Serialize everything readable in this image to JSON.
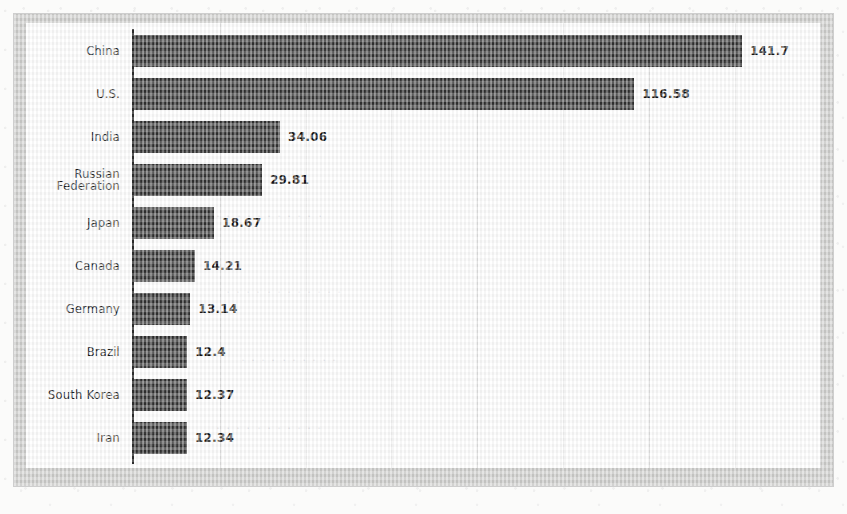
{
  "chart_data": {
    "type": "bar",
    "orientation": "horizontal",
    "title": "",
    "subtitle": "",
    "xlabel": "",
    "ylabel": "",
    "categories": [
      "China",
      "U.S.",
      "India",
      "Russian\nFederation",
      "Japan",
      "Canada",
      "Germany",
      "Brazil",
      "South Korea",
      "Iran"
    ],
    "values": [
      141.7,
      116.58,
      34.06,
      29.81,
      18.67,
      14.21,
      13.14,
      12.4,
      12.37,
      12.34
    ],
    "value_labels": [
      "141.7",
      "116.58",
      "34.06",
      "29.81",
      "18.67",
      "14.21",
      "13.14",
      "12.4",
      "12.37",
      "12.34"
    ],
    "xlim": [
      0,
      162
    ],
    "gridline_values": [
      20,
      40,
      60,
      80,
      100,
      120,
      140,
      160
    ],
    "grid": "vertical-only",
    "legend": "none",
    "tick_labels_x": [],
    "bar_color": "#3a3a3a",
    "gridline_color": "#e2e2e2",
    "axis_color": "#2f2f2f",
    "plot_background": "#ffffff",
    "frame_color": "#cfcfcd"
  },
  "figure": {
    "axis_line_label": "category-axis",
    "ghost_marks": [
      "U.S."
    ]
  }
}
